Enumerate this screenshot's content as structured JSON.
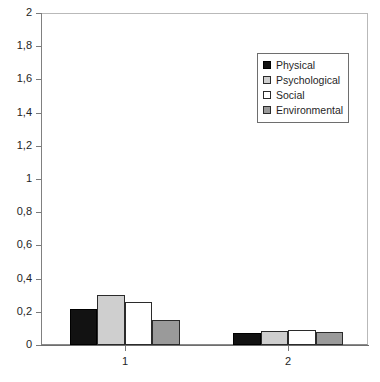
{
  "chart_data": {
    "type": "bar",
    "title": "",
    "subtitle": "",
    "xlabel": "",
    "ylabel": "",
    "categories": [
      "1",
      "2"
    ],
    "series": [
      {
        "name": "Physical",
        "color": "#121212",
        "values": [
          0.215,
          0.075
        ]
      },
      {
        "name": "Psychological",
        "color": "#cfcfcf",
        "values": [
          0.3,
          0.085
        ]
      },
      {
        "name": "Social",
        "color": "#ffffff",
        "values": [
          0.26,
          0.09
        ]
      },
      {
        "name": "Environmental",
        "color": "#9a9a9a",
        "values": [
          0.15,
          0.08
        ]
      }
    ],
    "ylim": [
      0,
      2
    ],
    "ytick_step": 0.2,
    "ytick_labels": [
      "0",
      "0,2",
      "0,4",
      "0,6",
      "0,8",
      "1",
      "1,2",
      "1,4",
      "1,6",
      "1,8",
      "2"
    ],
    "ytick_values": [
      0,
      0.2,
      0.4,
      0.6,
      0.8,
      1,
      1.2,
      1.4,
      1.6,
      1.8,
      2
    ],
    "decimal_separator": ",",
    "grid": false,
    "legend_position": "top-right",
    "legend_entries": [
      "Physical",
      "Psychological",
      "Social",
      "Environmental"
    ],
    "frame_color": "#b9b9b9",
    "axis_color": "#7a7a7a"
  }
}
